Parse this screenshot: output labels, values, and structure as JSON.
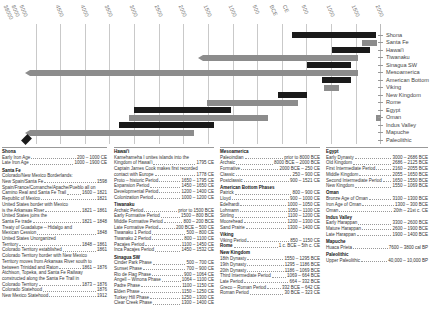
{
  "chart_data": {
    "type": "bar",
    "subtype": "horizontal-timeline",
    "title": "",
    "xlabel": "Years (BCE / CE)",
    "ylabel": "",
    "x_ticks": [
      "38000",
      "8000",
      "5000",
      "4500",
      "4000",
      "3500",
      "3000",
      "2500",
      "2000",
      "1500",
      "1000",
      "500",
      "BCE",
      "CE",
      "500",
      "1000",
      "1500",
      "2000"
    ],
    "grid": true,
    "legend_position": "right",
    "categories": [
      "Shona",
      "Santa Fe",
      "Hawai'i",
      "Tiwanaku",
      "Sinagua SW",
      "Mesoamerica",
      "American Bottom",
      "Viking",
      "New Kingdom",
      "Rome",
      "Egypt",
      "Oman",
      "Indus Valley",
      "Mapuche",
      "Paleolithic"
    ],
    "series": [
      {
        "name": "Shona",
        "start": 200,
        "end": 1900,
        "color": "#1a1a1a"
      },
      {
        "name": "Santa Fe",
        "start": 1598,
        "end": 1912,
        "color": "#8c8c8c"
      },
      {
        "name": "Hawai'i",
        "start": 1000,
        "end": 1795,
        "color": "#1a1a1a"
      },
      {
        "name": "Tiwanaku",
        "start": -1500,
        "end": 1532,
        "color": "#8c8c8c",
        "open_start": true
      },
      {
        "name": "Sinagua SW",
        "start": 500,
        "end": 1400,
        "color": "#1a1a1a"
      },
      {
        "name": "Mesoamerica",
        "start": -8000,
        "end": 1521,
        "color": "#8c8c8c",
        "open_start": true
      },
      {
        "name": "American Bottom",
        "start": 800,
        "end": 1400,
        "color": "#1a1a1a"
      },
      {
        "name": "Viking",
        "start": 850,
        "end": 1150,
        "color": "#8c8c8c"
      },
      {
        "name": "New Kingdom",
        "start": -1550,
        "end": -30,
        "color": "#1a1a1a"
      },
      {
        "name": "Rome",
        "start": -1500,
        "end": 300,
        "color": "#8c8c8c"
      },
      {
        "name": "Egypt",
        "start": -3000,
        "end": -1069,
        "color": "#1a1a1a"
      },
      {
        "name": "Oman",
        "start": -3100,
        "end": 200,
        "color": "#8c8c8c"
      },
      {
        "name": "Indus Valley",
        "start": -3300,
        "end": -1400,
        "color": "#1a1a1a"
      },
      {
        "name": "Mapuche",
        "start": -7600,
        "end": -1800,
        "color": "#8c8c8c",
        "open_start": true
      },
      {
        "name": "Paleolithic",
        "start": -38000,
        "end": -8000,
        "color": "#1a1a1a",
        "marker": "diamond"
      }
    ]
  },
  "axis": {
    "ticks": [
      {
        "label": "38000",
        "x": 6
      },
      {
        "label": "8000",
        "x": 14
      },
      {
        "label": "5000",
        "x": 22
      },
      {
        "label": "4500",
        "x": 58
      },
      {
        "label": "4000",
        "x": 83
      },
      {
        "label": "3500",
        "x": 107
      },
      {
        "label": "3000",
        "x": 132
      },
      {
        "label": "2500",
        "x": 157
      },
      {
        "label": "2000",
        "x": 181
      },
      {
        "label": "1500",
        "x": 206
      },
      {
        "label": "1000",
        "x": 231
      },
      {
        "label": "500",
        "x": 255
      },
      {
        "label": "BCE",
        "x": 272
      },
      {
        "label": "CE",
        "x": 285
      },
      {
        "label": "500",
        "x": 304
      },
      {
        "label": "1000",
        "x": 329
      },
      {
        "label": "1500",
        "x": 354
      },
      {
        "label": "2000",
        "x": 378
      }
    ]
  },
  "legend": [
    "Shona",
    "Santa Fe",
    "Hawai'i",
    "Tiwanaku",
    "Sinagua SW",
    "Mesoamerica",
    "American Bottom",
    "Viking",
    "New Kingdom",
    "Rome",
    "Egypt",
    "Oman",
    "Indus Valley",
    "Mapuche",
    "Paleolithic"
  ],
  "panels": {
    "col1": {
      "shona": {
        "title": "Shona",
        "rows": [
          {
            "name": "Early Iron Age",
            "value": "200 – 1000 CE"
          },
          {
            "name": "Late Iron Age",
            "value": "1000 – 1900 CE"
          }
        ]
      },
      "santa_fe": {
        "title": "Santa Fe",
        "lines": [
          {
            "text": "Colorado/New Mexico Borderlands:"
          },
          {
            "name": "New Spain/Santa Fe",
            "value": "1598"
          },
          {
            "text": "Spain/France/Comanche/Apache/Pueblo all on"
          },
          {
            "name": "Camino Real and Santa Fe Trail",
            "value": "1600 – 1821"
          },
          {
            "name": "Republic of Mexico",
            "value": "1821"
          },
          {
            "text": "United States border with Mexico"
          },
          {
            "name": "is the Arkansas River",
            "value": "1821 – 1861"
          },
          {
            "text": "United States joins the"
          },
          {
            "name": "Santa Fe trade",
            "value": "1821 – 1848"
          },
          {
            "text": "Treaty of Guadalupe – Hidalgo and"
          },
          {
            "name": "Mexican Cession",
            "value": "1848"
          },
          {
            "text": "United States Unorganized"
          },
          {
            "name": "Territory",
            "value": "1848 – 1861"
          },
          {
            "name": "Colorado Territory established",
            "value": "1861"
          },
          {
            "text": "Colorado Territory border with New Mexico"
          },
          {
            "text": "Territory moves from Arkansas River south to"
          },
          {
            "name": "between Trinidad and Raton",
            "value": "1861 – 1876"
          },
          {
            "text": "Atchison, Topeka, and Santa Fe Railway"
          },
          {
            "text": "constructed along the Santa Fe Trail in"
          },
          {
            "name": "Colorado Territory",
            "value": "1873 – 1876"
          },
          {
            "name": "Colorado Statehood",
            "value": "1876"
          },
          {
            "name": "New Mexico Statehood",
            "value": "1912"
          }
        ]
      }
    },
    "col2": {
      "hawaii": {
        "title": "Hawai'i",
        "lines": [
          {
            "text": "Kamehameha I unites islands into the"
          },
          {
            "name": "Kingdom of Hawai'i",
            "value": "1795 CE"
          },
          {
            "text": "Captain James Cook makes first recorded"
          },
          {
            "name": "contact with Europe",
            "value": "1778 CE"
          },
          {
            "name": "Proto – historic Period",
            "value": "1650 – 1795 CE"
          },
          {
            "name": "Expansion Period",
            "value": "1450 – 1650 CE"
          },
          {
            "name": "Developmental Period",
            "value": "1200 – 1400 CE"
          },
          {
            "name": "Colonization Period",
            "value": "1000 – 1200 CE"
          }
        ]
      },
      "tiwanaku": {
        "title": "Tiwanaku",
        "rows": [
          {
            "name": "Archaic Period",
            "value": "prior to 1500 BCE"
          },
          {
            "name": "Early Formative Period",
            "value": "1500 – 800 BCE"
          },
          {
            "name": "Middle Formative Period",
            "value": "800 – 200 BCE"
          },
          {
            "name": "Late Formative Period",
            "value": "200 BCE – 500 CE"
          },
          {
            "name": "Tiwanaku 1 Period",
            "value": "500 – 800 CE"
          },
          {
            "name": "Tiwanaku 2 Period",
            "value": "800 – 1100 CE"
          },
          {
            "name": "Pacajes Period",
            "value": "1100 – 1450 CE"
          },
          {
            "name": "Inca Pacajes Period",
            "value": "1450 – 1532 CE"
          }
        ]
      },
      "sinagua": {
        "title": "Sinagua SW",
        "rows": [
          {
            "name": "Cinder Park Phase",
            "value": "500 – 700 CE"
          },
          {
            "name": "Sunset Phase",
            "value": "700 – 900 CE"
          },
          {
            "name": "Rio de Flag Phase",
            "value": "900 – 1064 CE"
          },
          {
            "name": "Angell – Winona Phase",
            "value": "1064 – 1100 CE"
          },
          {
            "name": "Padre Phase",
            "value": "1100 – 1150 CE"
          },
          {
            "name": "Elden Phase",
            "value": "1150 – 1250 CE"
          },
          {
            "name": "Turkey Hill Phase",
            "value": "1250 – 1300 CE"
          },
          {
            "name": "Clear Creek Phase",
            "value": "1300 – 1400 CE"
          }
        ]
      }
    },
    "col3": {
      "mesoamerica": {
        "title": "Mesoamerica",
        "rows": [
          {
            "name": "Paleoindian",
            "value": "prior to 8000 BCE"
          },
          {
            "name": "Archaic",
            "value": "8000 BCE – 2000 BCE"
          },
          {
            "name": "Formative",
            "value": "2000 BCE – 250 CE"
          },
          {
            "name": "Classic",
            "value": "250 – 900 CE"
          },
          {
            "name": "Postclassic",
            "value": "900 – 1521 CE"
          }
        ]
      },
      "american_bottom": {
        "title": "American Bottom Phases",
        "rows": [
          {
            "name": "Patrick",
            "value": "800 – 900 CE"
          },
          {
            "name": "Lloyd",
            "value": "900 – 1000 CE"
          },
          {
            "name": "Edelhardt",
            "value": "1000 – 1050 CE"
          },
          {
            "name": "Lohmann",
            "value": "1050 – 1100 CE"
          },
          {
            "name": "Stirling",
            "value": "1100 – 1200 CE"
          },
          {
            "name": "Moorehead",
            "value": "1200 – 1300 CE"
          },
          {
            "name": "Sand Prairie",
            "value": "1300 – 1400 CE"
          }
        ]
      },
      "viking": {
        "title": "Viking",
        "rows": [
          {
            "name": "Viking Period",
            "value": "850 – 1150 CE"
          }
        ]
      },
      "rome": {
        "title": "Rome",
        "value": "1 c. BCE – 5th c. CE"
      },
      "new_kingdom": {
        "title": "New Kingdom",
        "rows": [
          {
            "name": "18th Dynasty",
            "value": "1550 – 1295 BCE"
          },
          {
            "name": "19th Dynasty",
            "value": "1295 – 1186 BCE"
          },
          {
            "name": "20th Dynasty",
            "value": "1186 – 1069 BCE"
          },
          {
            "name": "Third Intermediate Period",
            "value": "1069 – 664 BCE"
          },
          {
            "name": "Late Period",
            "value": "664 – 332 BCE"
          },
          {
            "name": "Greco – Roman Period",
            "value": "332 BCE – 642 CE"
          },
          {
            "name": "Roman Period",
            "value": "30 BCE – 323 CE"
          }
        ]
      }
    },
    "col4": {
      "egypt": {
        "title": "Egypt",
        "rows": [
          {
            "name": "Early Dynasty",
            "value": "3000 – 2686 BCE"
          },
          {
            "name": "Old Kingdom",
            "value": "2686 – 2125 BCE"
          },
          {
            "name": "First Intermediate Period",
            "value": "2160 – 2055 BCE"
          },
          {
            "name": "Middle Kingdom",
            "value": "2055 – 1650 BCE"
          },
          {
            "name": "Second Intermediate Period",
            "value": "1650 – 1550 BCE"
          },
          {
            "name": "New Kingdom",
            "value": "1550 – 1069 BCE"
          }
        ]
      },
      "oman": {
        "title": "Oman",
        "rows": [
          {
            "name": "Bronze Age of Oman",
            "value": "3100 – 1300 BCE"
          },
          {
            "name": "Iron Age of Oman",
            "value": "1300 – 300 BCE"
          },
          {
            "name": "Oman",
            "value": "20th – 21st c. CE"
          }
        ]
      },
      "indus": {
        "title": "Indus Valley",
        "rows": [
          {
            "name": "Early Harappan",
            "value": "3300 – 2600 BCE"
          },
          {
            "name": "Mature Harappan",
            "value": "2600 – 1900 BCE"
          },
          {
            "name": "Late Harappan",
            "value": "1900 – 1400 BCE"
          }
        ]
      },
      "mapuche": {
        "title": "Mapuche",
        "rows": [
          {
            "name": "Huaca Prieta",
            "value": "7600 – 3800 cal BP"
          }
        ]
      },
      "paleolithic": {
        "title": "Paleolithic",
        "rows": [
          {
            "name": "Upper Paleolithic",
            "value": "40,000 – 10,000 BP"
          }
        ]
      }
    }
  }
}
